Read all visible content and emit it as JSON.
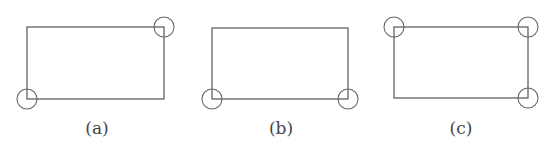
{
  "diagram": {
    "panels": [
      {
        "label": "(a)",
        "rect": {
          "x": 27,
          "y": 27,
          "w": 137,
          "h": 72
        },
        "circled_corners": [
          "top-right",
          "bottom-left"
        ],
        "label_pos": {
          "x": 97,
          "y": 134
        }
      },
      {
        "label": "(b)",
        "rect": {
          "x": 212,
          "y": 28,
          "w": 136,
          "h": 71
        },
        "circled_corners": [
          "bottom-left",
          "bottom-right"
        ],
        "label_pos": {
          "x": 281,
          "y": 134
        }
      },
      {
        "label": "(c)",
        "rect": {
          "x": 394,
          "y": 27,
          "w": 134,
          "h": 71
        },
        "circled_corners": [
          "top-left",
          "top-right",
          "bottom-right"
        ],
        "label_pos": {
          "x": 461,
          "y": 134
        }
      }
    ],
    "circle_radius": 10,
    "colors": {
      "stroke": "#555555",
      "background": "#ffffff"
    }
  }
}
